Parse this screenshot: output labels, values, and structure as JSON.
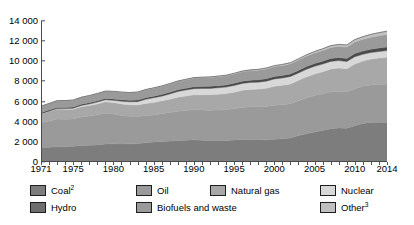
{
  "chart_data": {
    "type": "area",
    "title": "",
    "xlabel": "",
    "ylabel": "",
    "stacked": true,
    "grid": false,
    "legend_position": "bottom",
    "xlim": [
      1971,
      2014
    ],
    "ylim": [
      0,
      14000
    ],
    "y_ticks": [
      "0",
      "2 000",
      "4 000",
      "6 000",
      "8 000",
      "10 000",
      "12 000",
      "14 000"
    ],
    "y_tick_values": [
      0,
      2000,
      4000,
      6000,
      8000,
      10000,
      12000,
      14000
    ],
    "x_ticks": [
      "1971",
      "1975",
      "1980",
      "1985",
      "1990",
      "1995",
      "2000",
      "2005",
      "2010",
      "2014"
    ],
    "x_tick_values": [
      1971,
      1975,
      1980,
      1985,
      1990,
      1995,
      2000,
      2005,
      2010,
      2014
    ],
    "x": [
      1971,
      1972,
      1973,
      1974,
      1975,
      1976,
      1977,
      1978,
      1979,
      1980,
      1981,
      1982,
      1983,
      1984,
      1985,
      1986,
      1987,
      1988,
      1989,
      1990,
      1991,
      1992,
      1993,
      1994,
      1995,
      1996,
      1997,
      1998,
      1999,
      2000,
      2001,
      2002,
      2003,
      2004,
      2005,
      2006,
      2007,
      2008,
      2009,
      2010,
      2011,
      2012,
      2013,
      2014
    ],
    "series": [
      {
        "name": "Coal",
        "color": "#7d7d7d",
        "values": [
          1440,
          1470,
          1510,
          1520,
          1560,
          1620,
          1660,
          1700,
          1790,
          1800,
          1790,
          1800,
          1830,
          1900,
          1990,
          2020,
          2080,
          2140,
          2170,
          2200,
          2150,
          2120,
          2130,
          2140,
          2180,
          2220,
          2240,
          2220,
          2200,
          2260,
          2300,
          2380,
          2620,
          2800,
          2980,
          3140,
          3300,
          3370,
          3360,
          3600,
          3830,
          3930,
          3950,
          3930
        ]
      },
      {
        "name": "Oil",
        "color": "#9a9a9a",
        "values": [
          2440,
          2600,
          2770,
          2730,
          2700,
          2840,
          2900,
          2980,
          3060,
          2970,
          2830,
          2740,
          2690,
          2700,
          2680,
          2780,
          2830,
          2900,
          2950,
          3000,
          3010,
          3030,
          3030,
          3070,
          3110,
          3180,
          3250,
          3270,
          3320,
          3370,
          3390,
          3410,
          3470,
          3580,
          3620,
          3640,
          3670,
          3640,
          3600,
          3670,
          3690,
          3720,
          3760,
          3800
        ]
      },
      {
        "name": "Natural gas",
        "color": "#a8a8a8",
        "values": [
          890,
          940,
          980,
          990,
          980,
          1030,
          1050,
          1090,
          1130,
          1140,
          1150,
          1140,
          1140,
          1220,
          1250,
          1270,
          1330,
          1390,
          1440,
          1480,
          1520,
          1530,
          1570,
          1580,
          1640,
          1720,
          1720,
          1750,
          1800,
          1890,
          1920,
          1960,
          2020,
          2080,
          2140,
          2180,
          2270,
          2320,
          2290,
          2450,
          2500,
          2570,
          2610,
          2660
        ]
      },
      {
        "name": "Nuclear",
        "color": "#d8d8d8",
        "values": [
          29,
          38,
          50,
          65,
          100,
          120,
          150,
          180,
          190,
          210,
          260,
          290,
          330,
          400,
          450,
          470,
          510,
          560,
          580,
          600,
          620,
          630,
          640,
          650,
          670,
          680,
          690,
          690,
          710,
          720,
          730,
          740,
          730,
          750,
          760,
          760,
          750,
          740,
          720,
          730,
          670,
          640,
          650,
          670
        ]
      },
      {
        "name": "Hydro",
        "color": "#4a4a4a",
        "values": [
          100,
          105,
          110,
          115,
          120,
          120,
          125,
          130,
          135,
          140,
          145,
          150,
          155,
          160,
          165,
          170,
          175,
          180,
          185,
          190,
          195,
          200,
          205,
          210,
          215,
          220,
          225,
          230,
          235,
          240,
          245,
          250,
          255,
          265,
          270,
          280,
          290,
          295,
          300,
          315,
          320,
          330,
          345,
          350
        ]
      },
      {
        "name": "Biofuels and waste",
        "color": "#9a9a9a",
        "values": [
          640,
          650,
          660,
          670,
          680,
          690,
          700,
          710,
          720,
          740,
          750,
          760,
          780,
          790,
          800,
          810,
          830,
          840,
          850,
          870,
          880,
          890,
          900,
          910,
          930,
          940,
          950,
          960,
          980,
          990,
          1000,
          1010,
          1030,
          1040,
          1060,
          1080,
          1100,
          1120,
          1140,
          1160,
          1180,
          1200,
          1220,
          1240
        ]
      },
      {
        "name": "Other",
        "color": "#c0c0c0",
        "values": [
          5,
          6,
          7,
          8,
          9,
          10,
          11,
          12,
          13,
          14,
          16,
          18,
          20,
          22,
          25,
          27,
          30,
          33,
          36,
          40,
          44,
          48,
          52,
          57,
          62,
          68,
          74,
          80,
          88,
          96,
          104,
          113,
          123,
          134,
          146,
          160,
          176,
          193,
          208,
          230,
          255,
          282,
          310,
          340
        ]
      }
    ]
  },
  "legend": {
    "row1": [
      {
        "label": "Coal",
        "sup": "2",
        "color": "#7d7d7d",
        "name": "legend-coal"
      },
      {
        "label": "Oil",
        "sup": "",
        "color": "#9a9a9a",
        "name": "legend-oil"
      },
      {
        "label": "Natural gas",
        "sup": "",
        "color": "#a8a8a8",
        "name": "legend-natural-gas"
      },
      {
        "label": "Nuclear",
        "sup": "",
        "color": "#d8d8d8",
        "name": "legend-nuclear"
      }
    ],
    "row2": [
      {
        "label": "Hydro",
        "sup": "",
        "color": "#6e6e6e",
        "name": "legend-hydro"
      },
      {
        "label": "Biofuels and waste",
        "sup": "",
        "color": "#9a9a9a",
        "name": "legend-biofuels-and-waste"
      },
      {
        "label": "Other",
        "sup": "3",
        "color": "#c0c0c0",
        "name": "legend-other"
      }
    ]
  },
  "colors": {
    "axis": "#4a4a4a",
    "outline": "#1e1e1e",
    "background": "#ffffff"
  }
}
